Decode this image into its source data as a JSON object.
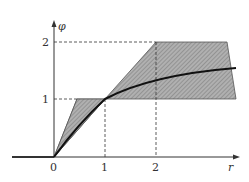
{
  "diagram": {
    "y_axis_label": "φ",
    "x_axis_label": "r",
    "x_ticks": [
      "0",
      "1",
      "2"
    ],
    "y_ticks": [
      "1",
      "2"
    ],
    "colors": {
      "shade": "#a8a8a8",
      "hatch": "#6e6e6e",
      "curve": "#111111",
      "axis": "#333333"
    }
  }
}
